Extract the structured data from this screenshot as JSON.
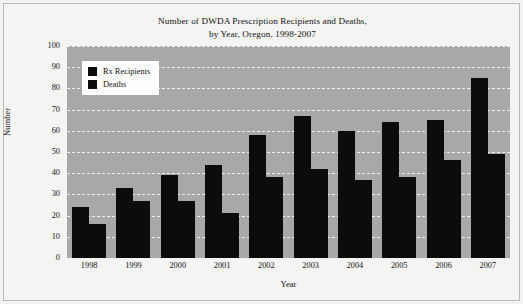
{
  "chart_data": {
    "type": "bar",
    "title": "Number of DWDA Prescription Recipients and Deaths,",
    "subtitle": "by Year, Oregon, 1998-2007",
    "xlabel": "Year",
    "ylabel": "Number",
    "categories": [
      "1998",
      "1999",
      "2000",
      "2001",
      "2002",
      "2003",
      "2004",
      "2005",
      "2006",
      "2007"
    ],
    "series": [
      {
        "name": "Rx Recipients",
        "color": "#0c0c0c",
        "values": [
          24,
          33,
          39,
          44,
          58,
          67,
          60,
          64,
          65,
          85
        ]
      },
      {
        "name": "Deaths",
        "color": "#0c0c0c",
        "values": [
          16,
          27,
          27,
          21,
          38,
          42,
          37,
          38,
          46,
          49
        ]
      }
    ],
    "ylim": [
      0,
      100
    ],
    "yticks": [
      "100",
      "90",
      "80",
      "70",
      "60",
      "50",
      "40",
      "30",
      "20",
      "10",
      "0"
    ],
    "grid": true,
    "grid_style": "dashed-white-horizontal",
    "plot_background": "#a8a8a8",
    "legend_position": "top-left-inside"
  }
}
